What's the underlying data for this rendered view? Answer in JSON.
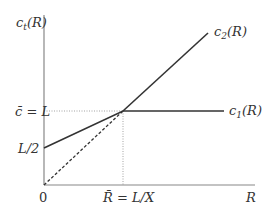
{
  "diagram": {
    "y_axis_label": {
      "main": "c",
      "sub": "t",
      "arg": "(R)"
    },
    "x_axis_label": "R",
    "origin_label": "0",
    "y_ticks": [
      {
        "id": "cbar",
        "text": "c̄ = L"
      },
      {
        "id": "half",
        "text": "L/2"
      }
    ],
    "x_ticks": [
      {
        "id": "rbar",
        "text": "R̄ = L/X"
      }
    ],
    "curves": [
      {
        "id": "c1",
        "label_main": "c",
        "label_sub": "1",
        "label_arg": "(R)",
        "style": "solid",
        "description": "starts at L/2, rises to (R̄, L) then flat"
      },
      {
        "id": "c2",
        "label_main": "c",
        "label_sub": "2",
        "label_arg": "(R)",
        "style": "solid",
        "description": "line from origin through (R̄, L), continuing upward"
      },
      {
        "id": "c2_lower",
        "style": "dashed",
        "description": "dashed segment of c2 from origin to (R̄, L)"
      }
    ],
    "guides": [
      {
        "id": "h_guide",
        "style": "dotted",
        "description": "horizontal at c̄ = L"
      },
      {
        "id": "v_guide",
        "style": "dotted",
        "description": "vertical at R̄ = L/X"
      }
    ],
    "colors": {
      "line": "#333333",
      "axis": "#888888",
      "guide": "#999999"
    }
  }
}
